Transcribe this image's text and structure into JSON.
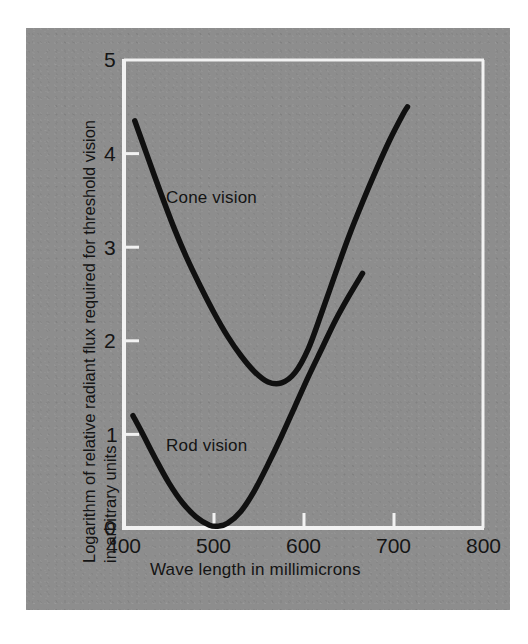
{
  "figure": {
    "panel_color": "#8d8d8d",
    "axis_color": "#f2f2f2",
    "curve_color": "#101010",
    "text_color": "#141414"
  },
  "chart_data": {
    "type": "line",
    "title": "",
    "xlabel": "Wave length in millimicrons",
    "ylabel": "Logarithm of relative radiant flux required for threshold vision in arbitrary units",
    "ylabel_line1": "Logarithm of relative radiant flux required for threshold vision",
    "ylabel_line2": "in arbitrary units",
    "xlim": [
      400,
      800
    ],
    "ylim": [
      0,
      5
    ],
    "xticks": [
      400,
      500,
      600,
      700,
      800
    ],
    "yticks": [
      0,
      1,
      2,
      3,
      4,
      5
    ],
    "xtick_labels": [
      "400",
      "500",
      "600",
      "700",
      "800"
    ],
    "ytick_labels": [
      "0",
      "1",
      "2",
      "3",
      "4",
      "5"
    ],
    "grid": false,
    "legend": "inline-annotations",
    "series": [
      {
        "name": "Cone vision",
        "label_x": 470,
        "label_y": 3.6,
        "x": [
          412,
          425,
          440,
          455,
          470,
          485,
          500,
          515,
          530,
          545,
          560,
          575,
          590,
          605,
          620,
          635,
          650,
          665,
          680,
          695,
          710,
          715
        ],
        "y": [
          4.35,
          4.0,
          3.6,
          3.22,
          2.88,
          2.58,
          2.3,
          2.05,
          1.84,
          1.67,
          1.56,
          1.55,
          1.66,
          1.92,
          2.31,
          2.72,
          3.12,
          3.48,
          3.82,
          4.14,
          4.42,
          4.5
        ]
      },
      {
        "name": "Rod vision",
        "label_x": 448,
        "label_y": 0.95,
        "x": [
          410,
          420,
          435,
          450,
          465,
          480,
          495,
          505,
          515,
          530,
          545,
          560,
          575,
          590,
          605,
          620,
          635,
          650,
          665
        ],
        "y": [
          1.2,
          1.02,
          0.74,
          0.48,
          0.27,
          0.12,
          0.03,
          0.02,
          0.05,
          0.18,
          0.4,
          0.68,
          0.98,
          1.3,
          1.62,
          1.92,
          2.22,
          2.48,
          2.72
        ]
      }
    ]
  }
}
